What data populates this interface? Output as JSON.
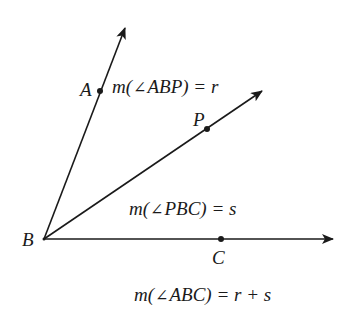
{
  "figure": {
    "points": {
      "A": {
        "label": "A",
        "x": 100,
        "y": 91
      },
      "B": {
        "label": "B",
        "x": 44,
        "y": 239
      },
      "P": {
        "label": "P",
        "x": 207,
        "y": 129
      },
      "C": {
        "label": "C",
        "x": 221,
        "y": 239
      }
    },
    "rays": [
      {
        "name": "ray-BA",
        "from": "B",
        "through": "A",
        "tip": [
          125,
          28
        ]
      },
      {
        "name": "ray-BP",
        "from": "B",
        "through": "P",
        "tip": [
          262,
          91
        ]
      },
      {
        "name": "ray-BC",
        "from": "B",
        "through": "C",
        "tip": [
          333,
          239
        ]
      }
    ],
    "equations": {
      "abp": {
        "prefix": "m(",
        "angle": "∠",
        "name": "ABP",
        "suffix": ") = r"
      },
      "pbc": {
        "prefix": "m(",
        "angle": "∠",
        "name": "PBC",
        "suffix": ") = s"
      },
      "abc": {
        "prefix": "m(",
        "angle": "∠",
        "name": "ABC",
        "suffix": ") = r + s"
      }
    },
    "colors": {
      "ink": "#1a1a1a",
      "background": "#ffffff"
    }
  }
}
